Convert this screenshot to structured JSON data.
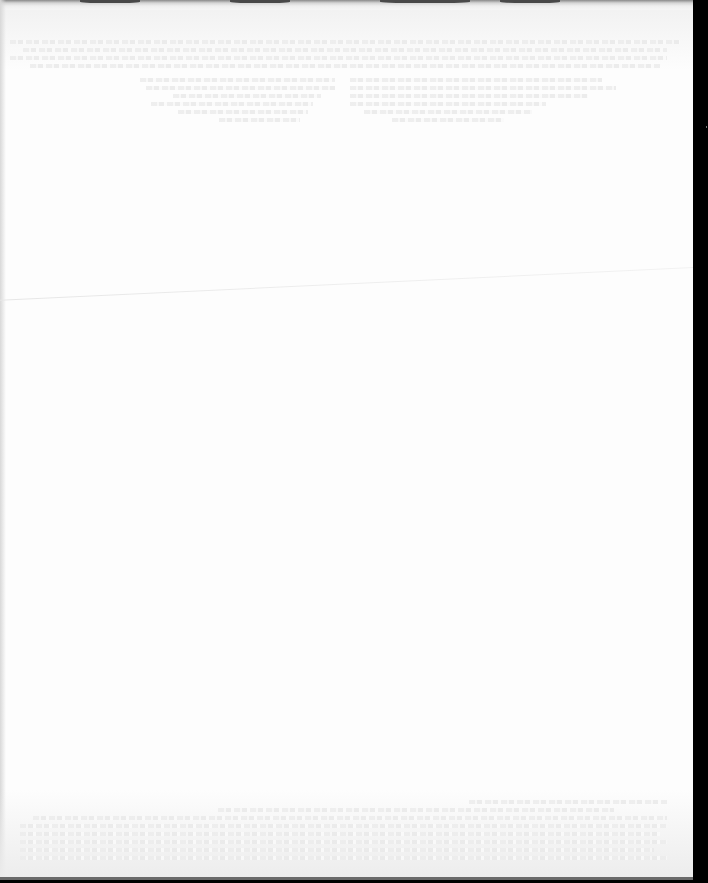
{
  "document": {
    "type": "scanned-page",
    "content_state": "blank",
    "legible_text": [],
    "features": {
      "bleed_through_text": "illegible",
      "top_scan_edge": true,
      "right_black_border": true,
      "left_edge_shadow": true,
      "crease_line": true
    },
    "colors": {
      "paper": "#fdfdfd",
      "border": "#000000",
      "bleed_through": "#ececec"
    },
    "bleed_regions": [
      {
        "name": "top-band",
        "x": 10,
        "y": 40,
        "w": 670,
        "lines": 4
      },
      {
        "name": "column-left",
        "x": 70,
        "y": 78,
        "w": 270,
        "lines": 6
      },
      {
        "name": "column-right",
        "x": 350,
        "y": 78,
        "w": 280,
        "lines": 6
      },
      {
        "name": "bottom-band",
        "x": 20,
        "y": 800,
        "w": 660,
        "lines": 8
      }
    ]
  }
}
